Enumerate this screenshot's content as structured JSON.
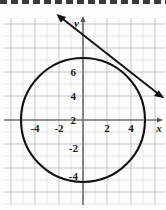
{
  "figure": {
    "background_color": "#fdfdfc",
    "grid_color": "#d9dcd6",
    "grid_major_color": "#b9bfc6",
    "axis_color": "#6e7277",
    "curve_color": "#111111",
    "top_edge_color": "#3a3a3a"
  },
  "axes": {
    "x_label": "x",
    "y_label": "y",
    "x_ticks": [
      "-4",
      "-2",
      "2",
      "4"
    ],
    "x_tick_values": [
      -4,
      -2,
      2,
      4
    ],
    "y_ticks": [
      "6",
      "4",
      "2",
      "-2",
      "-4"
    ],
    "y_tick_values": [
      6,
      4,
      2,
      -2,
      -4
    ],
    "xlim": [
      -5.8,
      6.9
    ],
    "ylim": [
      -6.2,
      9.2
    ],
    "grid": true,
    "grid_step": 1
  },
  "chart_data": {
    "type": "line",
    "title": "",
    "xlabel": "x",
    "ylabel": "y",
    "grid": true,
    "legend": null,
    "xlim": [
      -5.8,
      6.9
    ],
    "ylim": [
      -6.2,
      9.2
    ],
    "xticks": [
      -4,
      -2,
      2,
      4
    ],
    "yticks": [
      6,
      4,
      2,
      -2,
      -4
    ],
    "series": [
      {
        "name": "circle",
        "type": "circle",
        "center": [
          0,
          0
        ],
        "radius": 5,
        "equation": "x^2 + y^2 = 25",
        "color": "#111111",
        "arrows": false
      },
      {
        "name": "tangent-line",
        "type": "line",
        "slope": -0.65,
        "intercept": 6.3,
        "equation": "y = -0.65x + 6.3",
        "x_from": -2.2,
        "x_to": 6.7,
        "y_from": 8.8,
        "y_to": 1.9,
        "tangent_point": [
          3.5,
          3.6
        ],
        "color": "#111111",
        "arrows": "both"
      }
    ]
  }
}
